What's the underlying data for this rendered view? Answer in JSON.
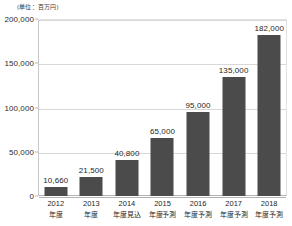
{
  "chart_data": {
    "type": "bar",
    "title": "",
    "subtitle": "",
    "unit_caption": "(単位：百万円)",
    "xlabel": "",
    "ylabel": "",
    "ylim": [
      0,
      200000
    ],
    "grid": true,
    "legend": null,
    "categories": [
      "2012年度",
      "2013年度",
      "2014年度見込",
      "2015年度予測",
      "2016年度予測",
      "2017年度予測",
      "2018年度予測"
    ],
    "category_lines": [
      {
        "line1": "2012",
        "line2": "年度"
      },
      {
        "line1": "2013",
        "line2": "年度"
      },
      {
        "line1": "2014",
        "line2": "年度見込"
      },
      {
        "line1": "2015",
        "line2": "年度予測"
      },
      {
        "line1": "2016",
        "line2": "年度予測"
      },
      {
        "line1": "2017",
        "line2": "年度予測"
      },
      {
        "line1": "2018",
        "line2": "年度予測"
      }
    ],
    "values": [
      10660,
      21500,
      40800,
      65000,
      95000,
      135000,
      182000
    ],
    "value_labels": [
      "10,660",
      "21,500",
      "40,800",
      "65,000",
      "95,000",
      "135,000",
      "182,000"
    ],
    "yticks": [
      0,
      50000,
      100000,
      150000,
      200000
    ],
    "ytick_labels": [
      "0",
      "50,000",
      "100,000",
      "150,000",
      "200,000"
    ],
    "bar_color": "#4b4b4b",
    "grid_color": "#d8d8d8",
    "background": "#ffffff"
  }
}
